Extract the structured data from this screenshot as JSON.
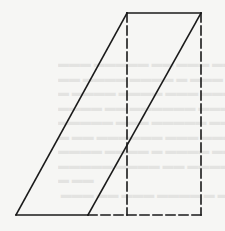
{
  "diagram": {
    "stroke_color": "#1a1a1a",
    "background_color": "#f6f6f4",
    "parallelogram": {
      "vertices": [
        [
          16,
          215
        ],
        [
          88,
          215
        ],
        [
          201,
          13
        ],
        [
          127,
          13
        ]
      ],
      "style": "solid"
    },
    "rectangle": {
      "x": 127,
      "y": 13,
      "width": 74,
      "height": 202,
      "style": "dashed"
    },
    "solid_segments": [
      {
        "name": "top-edge",
        "x1": 127,
        "y1": 13,
        "x2": 201,
        "y2": 13
      },
      {
        "name": "left-slant-edge",
        "x1": 16,
        "y1": 215,
        "x2": 127,
        "y2": 13
      },
      {
        "name": "right-slant-edge",
        "x1": 88,
        "y1": 215,
        "x2": 201,
        "y2": 13
      },
      {
        "name": "bottom-solid-edge",
        "x1": 16,
        "y1": 215,
        "x2": 88,
        "y2": 215
      }
    ],
    "dashed_segments": [
      {
        "name": "left-vertical-dashed",
        "x1": 127,
        "y1": 13,
        "x2": 127,
        "y2": 215
      },
      {
        "name": "right-vertical-dashed",
        "x1": 201,
        "y1": 13,
        "x2": 201,
        "y2": 215
      },
      {
        "name": "bottom-dashed-edge",
        "x1": 88,
        "y1": 215,
        "x2": 201,
        "y2": 215
      }
    ]
  }
}
